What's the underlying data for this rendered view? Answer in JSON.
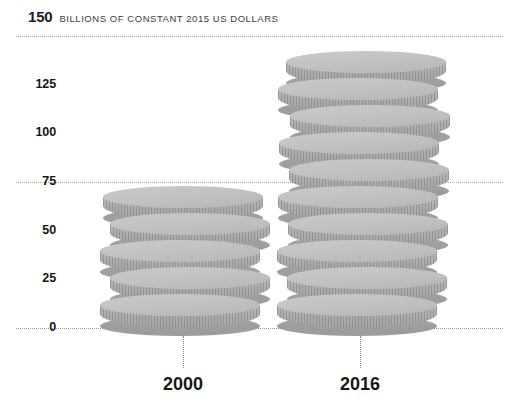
{
  "header": {
    "value": "150",
    "unit": "BILLIONS OF CONSTANT 2015 US DOLLARS"
  },
  "axis": {
    "y_ticks": [
      "150",
      "125",
      "100",
      "75",
      "50",
      "25",
      "0"
    ],
    "x_labels": [
      "2000",
      "2016"
    ]
  },
  "colors": {
    "coin_top": "#c4c4c4",
    "coin_side": "#a8a8a8",
    "coin_shadow": "#9b9b9b",
    "gridline": "#a9a9a9",
    "text": "#171717",
    "unit_text": "#3d3d3d",
    "background": "#ffffff"
  },
  "chart_data": {
    "type": "bar",
    "title": "",
    "subtitle": "",
    "xlabel": "",
    "ylabel": "BILLIONS OF CONSTANT 2015 US DOLLARS",
    "categories": [
      "2000",
      "2016"
    ],
    "values": [
      72,
      144
    ],
    "ylim": [
      0,
      150
    ],
    "yticks": [
      0,
      25,
      50,
      75,
      100,
      125,
      150
    ],
    "gridlines_at": [
      0,
      75,
      150
    ],
    "grid": true,
    "legend": "none",
    "series": [
      {
        "name": "Official development assistance",
        "values": [
          72,
          144
        ]
      }
    ],
    "marks": {
      "style": "stacked-coins",
      "coins_per_stack": [
        5,
        10
      ],
      "unit_per_coin": 14.4,
      "note": "Each bar is drawn as a stack of 3-D coins with milled edges; coins alternate horizontal offset."
    },
    "annotations": [
      {
        "text": "150",
        "role": "axis-max-callout"
      },
      {
        "text": "BILLIONS OF CONSTANT 2015 US DOLLARS",
        "role": "unit-caption"
      }
    ]
  },
  "coin_stacks": [
    {
      "name": "2000",
      "coins": [
        {
          "offset": 0,
          "bottom": 0
        },
        {
          "offset": 10,
          "bottom": 27
        },
        {
          "offset": 0,
          "bottom": 54
        },
        {
          "offset": 10,
          "bottom": 81
        },
        {
          "offset": 3,
          "bottom": 108
        }
      ]
    },
    {
      "name": "2016",
      "coins": [
        {
          "offset": 0,
          "bottom": 0
        },
        {
          "offset": 10,
          "bottom": 27
        },
        {
          "offset": 0,
          "bottom": 54
        },
        {
          "offset": 11,
          "bottom": 81
        },
        {
          "offset": 1,
          "bottom": 108
        },
        {
          "offset": 12,
          "bottom": 135
        },
        {
          "offset": 2,
          "bottom": 162
        },
        {
          "offset": 13,
          "bottom": 189
        },
        {
          "offset": 1,
          "bottom": 216
        },
        {
          "offset": 9,
          "bottom": 243
        }
      ]
    }
  ]
}
